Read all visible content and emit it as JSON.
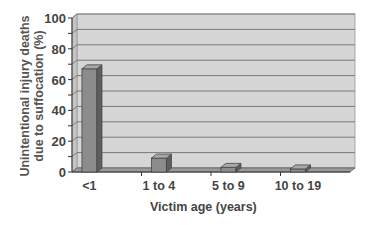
{
  "chart_data": {
    "type": "bar",
    "title": "",
    "xlabel": "Victim age (years)",
    "ylabel": "Unintentional injury deaths due to suffocation (%)",
    "ylabel_lines": [
      "Unintentional injury deaths",
      "due to suffocation (%)"
    ],
    "categories": [
      "<1",
      "1 to 4",
      "5 to 9",
      "10 to 19"
    ],
    "values": [
      67,
      9,
      3,
      2
    ],
    "ylim": [
      0,
      100
    ],
    "yticks": [
      0,
      20,
      40,
      60,
      80,
      100
    ],
    "minor_grid_step": 10,
    "grid": true,
    "legend": "none",
    "style": "3d-column"
  },
  "colors": {
    "bar_front": "#8c8c8c",
    "bar_side": "#5e5e5e",
    "bar_top": "#a8a8a8",
    "wall": "#d6d6d6",
    "floor": "#9a9a9a",
    "gridline": "#7a7a7a",
    "text": "#444444"
  }
}
